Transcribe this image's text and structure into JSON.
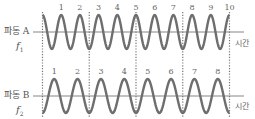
{
  "diagram": {
    "title": "",
    "colors": {
      "wave": "#707070",
      "axis": "#808080",
      "dotted": "#777777",
      "text": "#555555"
    },
    "wave_a": {
      "label": "파동 A",
      "freq_symbol": "f",
      "freq_sub": "1",
      "time_label": "시간",
      "cycles": 10,
      "peak_labels": [
        "1",
        "2",
        "3",
        "4",
        "5",
        "6",
        "7",
        "8",
        "9",
        "10"
      ]
    },
    "wave_b": {
      "label": "파동 B",
      "freq_symbol": "f",
      "freq_sub": "2",
      "time_label": "시간",
      "cycles": 8,
      "peak_labels": [
        "1",
        "2",
        "3",
        "4",
        "5",
        "6",
        "7",
        "8"
      ]
    },
    "dotted_lines_count": 5
  }
}
